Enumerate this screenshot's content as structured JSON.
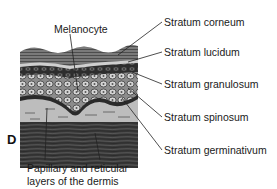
{
  "diagram": {
    "panel_letter": "D",
    "labels": {
      "melanocyte": "Melanocyte",
      "stratum_corneum": "Stratum corneum",
      "stratum_lucidum": "Stratum lucidum",
      "stratum_granulosum": "Stratum granulosum",
      "stratum_spinosum": "Stratum spinosum",
      "stratum_germinativum": "Stratum germinativum",
      "dermis_line1": "Papillary and reticular",
      "dermis_line2": "layers of the dermis"
    },
    "colors": {
      "corneum": "#6e6e6e",
      "lucidum": "#c9c9c9",
      "granulosum": "#4a4a4a",
      "spinosum": "#a8a8a8",
      "papillary": "#bdbdbd",
      "reticular": "#3c3c3c",
      "leader": "#222222"
    }
  }
}
